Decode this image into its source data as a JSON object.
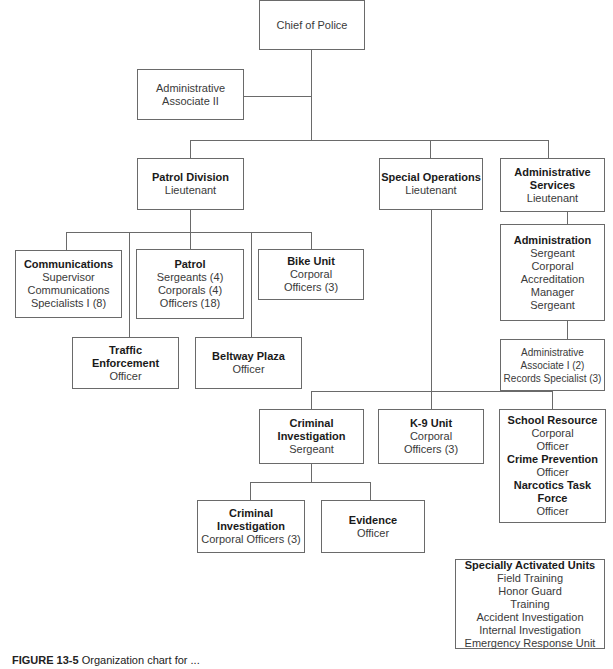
{
  "chart": {
    "chief": {
      "title": "",
      "lines": [
        "Chief of Police"
      ]
    },
    "admin_assoc_ii": {
      "lines": [
        "Administrative",
        "Associate II"
      ]
    },
    "patrol_division": {
      "title": "Patrol Division",
      "lines": [
        "Lieutenant"
      ]
    },
    "special_operations": {
      "title": "Special Operations",
      "lines": [
        "Lieutenant"
      ]
    },
    "administrative_services": {
      "title": "Administrative Services",
      "title_lines": [
        "Administrative",
        "Services"
      ],
      "lines": [
        "Lieutenant"
      ]
    },
    "communications": {
      "title": "Communications",
      "lines": [
        "Supervisor",
        "Communications",
        "Specialists I (8)"
      ]
    },
    "patrol": {
      "title": "Patrol",
      "lines": [
        "Sergeants (4)",
        "Corporals (4)",
        "Officers (18)"
      ]
    },
    "bike_unit": {
      "title": "Bike Unit",
      "lines": [
        "Corporal",
        "Officers (3)"
      ]
    },
    "traffic_enforcement": {
      "title_lines": [
        "Traffic",
        "Enforcement"
      ],
      "lines": [
        "Officer"
      ]
    },
    "beltway_plaza": {
      "title": "Beltway Plaza",
      "lines": [
        "Officer"
      ]
    },
    "administration": {
      "title": "Administration",
      "lines": [
        "Sergeant",
        "Corporal",
        "Accreditation",
        "Manager",
        "Sergeant"
      ]
    },
    "admin_support": {
      "lines": [
        "Administrative",
        "Associate I (2)",
        "Records Specialist (3)"
      ]
    },
    "criminal_investigation": {
      "title_lines": [
        "Criminal",
        "Investigation"
      ],
      "lines": [
        "Sergeant"
      ]
    },
    "k9_unit": {
      "title": "K-9 Unit",
      "lines": [
        "Corporal",
        "Officers (3)"
      ]
    },
    "school_resource": {
      "sections": [
        {
          "title": "School Resource",
          "lines": [
            "Corporal",
            "Officer"
          ]
        },
        {
          "title": "Crime Prevention",
          "lines": [
            "Officer"
          ]
        },
        {
          "title_lines": [
            "Narcotics Task",
            "Force"
          ],
          "lines": [
            "Officer"
          ]
        }
      ]
    },
    "ci_corporal": {
      "title_lines": [
        "Criminal",
        "Investigation"
      ],
      "lines": [
        "Corporal Officers (3)"
      ]
    },
    "evidence": {
      "title": "Evidence",
      "lines": [
        "Officer"
      ]
    },
    "specially_activated": {
      "title": "Specially Activated Units",
      "lines": [
        "Field Training",
        "Honor Guard",
        "Training",
        "Accident Investigation",
        "Internal Investigation",
        "Emergency Response Unit"
      ]
    }
  },
  "caption": {
    "label": "FIGURE 13-5",
    "text": "Organization chart for ..."
  }
}
